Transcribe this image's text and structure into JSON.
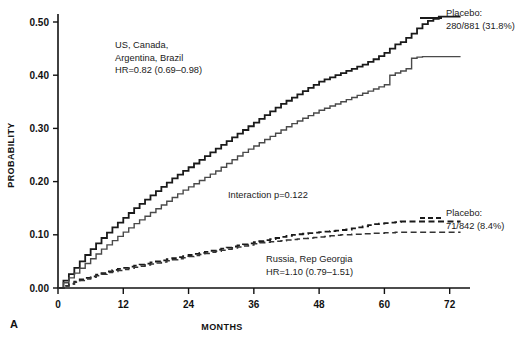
{
  "figure": {
    "panel_letter": "A",
    "background": "#ffffff"
  },
  "chart_data": {
    "type": "line",
    "title": "",
    "subtitle": "",
    "xlabel": "MONTHS",
    "ylabel": "PROBABILITY",
    "xlim": [
      0,
      75
    ],
    "ylim": [
      0.0,
      0.53
    ],
    "xticks": [
      0,
      12,
      24,
      36,
      48,
      60,
      72
    ],
    "xtick_labels": [
      "0",
      "12",
      "24",
      "36",
      "48",
      "60",
      "72"
    ],
    "yticks": [
      0.0,
      0.1,
      0.2,
      0.3,
      0.4,
      0.5
    ],
    "ytick_labels": [
      "0.00",
      "0.10",
      "0.20",
      "0.30",
      "0.40",
      "0.50"
    ],
    "grid": false,
    "legend_position": "right-inline",
    "curve_style": "kaplan-meier-step",
    "series": [
      {
        "name": "US, Canada, Argentina, Brazil — Placebo",
        "linestyle": "solid",
        "color": "#1a1a1a",
        "linewidth": 1.8,
        "x": [
          0,
          1,
          2,
          3,
          4,
          5,
          6,
          7,
          8,
          9,
          10,
          11,
          12,
          13,
          14,
          15,
          16,
          17,
          18,
          19,
          20,
          21,
          22,
          23,
          24,
          25,
          26,
          27,
          28,
          29,
          30,
          31,
          32,
          33,
          34,
          35,
          36,
          37,
          38,
          39,
          40,
          41,
          42,
          43,
          44,
          45,
          46,
          47,
          48,
          49,
          50,
          51,
          52,
          53,
          54,
          55,
          56,
          57,
          58,
          59,
          60,
          61,
          62,
          63,
          64,
          65,
          66,
          67,
          68,
          69,
          70,
          71,
          72,
          73,
          74
        ],
        "y": [
          0.0,
          0.014,
          0.026,
          0.038,
          0.05,
          0.062,
          0.073,
          0.084,
          0.094,
          0.104,
          0.114,
          0.123,
          0.132,
          0.141,
          0.15,
          0.158,
          0.166,
          0.174,
          0.182,
          0.19,
          0.198,
          0.206,
          0.213,
          0.22,
          0.227,
          0.234,
          0.241,
          0.248,
          0.255,
          0.262,
          0.269,
          0.276,
          0.283,
          0.29,
          0.297,
          0.304,
          0.311,
          0.318,
          0.325,
          0.332,
          0.339,
          0.346,
          0.352,
          0.358,
          0.364,
          0.37,
          0.376,
          0.382,
          0.388,
          0.392,
          0.396,
          0.4,
          0.404,
          0.408,
          0.412,
          0.416,
          0.42,
          0.425,
          0.43,
          0.436,
          0.442,
          0.45,
          0.458,
          0.462,
          0.47,
          0.478,
          0.488,
          0.496,
          0.502,
          0.506,
          0.51,
          0.51,
          0.51,
          0.51,
          0.51
        ]
      },
      {
        "name": "US, Canada, Argentina, Brazil — Treatment",
        "linestyle": "solid",
        "color": "#4a4a4a",
        "linewidth": 1.4,
        "x": [
          0,
          1,
          2,
          3,
          4,
          5,
          6,
          7,
          8,
          9,
          10,
          11,
          12,
          13,
          14,
          15,
          16,
          17,
          18,
          19,
          20,
          21,
          22,
          23,
          24,
          25,
          26,
          27,
          28,
          29,
          30,
          31,
          32,
          33,
          34,
          35,
          36,
          37,
          38,
          39,
          40,
          41,
          42,
          43,
          44,
          45,
          46,
          47,
          48,
          49,
          50,
          51,
          52,
          53,
          54,
          55,
          56,
          57,
          58,
          59,
          60,
          61,
          62,
          63,
          64,
          65,
          66,
          67,
          68,
          69,
          70,
          71,
          72,
          73,
          74
        ],
        "y": [
          0.0,
          0.01,
          0.019,
          0.028,
          0.037,
          0.046,
          0.055,
          0.064,
          0.073,
          0.081,
          0.089,
          0.097,
          0.105,
          0.113,
          0.121,
          0.128,
          0.135,
          0.142,
          0.149,
          0.156,
          0.163,
          0.17,
          0.177,
          0.184,
          0.19,
          0.196,
          0.202,
          0.208,
          0.214,
          0.22,
          0.227,
          0.234,
          0.241,
          0.248,
          0.255,
          0.261,
          0.267,
          0.273,
          0.279,
          0.285,
          0.291,
          0.297,
          0.303,
          0.309,
          0.314,
          0.319,
          0.324,
          0.329,
          0.334,
          0.338,
          0.342,
          0.346,
          0.35,
          0.354,
          0.358,
          0.362,
          0.366,
          0.37,
          0.374,
          0.378,
          0.382,
          0.4,
          0.404,
          0.408,
          0.412,
          0.432,
          0.434,
          0.435,
          0.435,
          0.435,
          0.435,
          0.435,
          0.435,
          0.435,
          0.435
        ]
      },
      {
        "name": "Russia, Rep Georgia — Placebo",
        "linestyle": "dashed",
        "color": "#1a1a1a",
        "linewidth": 1.8,
        "x": [
          0,
          1,
          2,
          3,
          4,
          5,
          6,
          7,
          8,
          9,
          10,
          11,
          12,
          13,
          14,
          15,
          16,
          17,
          18,
          19,
          20,
          21,
          22,
          23,
          24,
          25,
          26,
          27,
          28,
          29,
          30,
          31,
          32,
          33,
          34,
          35,
          36,
          37,
          38,
          39,
          40,
          41,
          42,
          43,
          44,
          45,
          46,
          47,
          48,
          49,
          50,
          51,
          52,
          53,
          54,
          55,
          56,
          57,
          58,
          59,
          60,
          61,
          62,
          63,
          64,
          65,
          66,
          67,
          68,
          69,
          70,
          71,
          72,
          73,
          74
        ],
        "y": [
          0.0,
          0.004,
          0.008,
          0.012,
          0.016,
          0.019,
          0.022,
          0.025,
          0.028,
          0.031,
          0.034,
          0.036,
          0.038,
          0.04,
          0.042,
          0.044,
          0.046,
          0.048,
          0.05,
          0.052,
          0.054,
          0.056,
          0.058,
          0.06,
          0.062,
          0.064,
          0.066,
          0.068,
          0.07,
          0.072,
          0.074,
          0.076,
          0.078,
          0.08,
          0.082,
          0.084,
          0.086,
          0.088,
          0.09,
          0.092,
          0.094,
          0.096,
          0.098,
          0.1,
          0.101,
          0.102,
          0.103,
          0.104,
          0.105,
          0.106,
          0.107,
          0.108,
          0.109,
          0.11,
          0.112,
          0.114,
          0.116,
          0.118,
          0.12,
          0.121,
          0.122,
          0.123,
          0.124,
          0.125,
          0.125,
          0.125,
          0.125,
          0.125,
          0.125,
          0.125,
          0.125,
          0.125,
          0.125,
          0.125,
          0.125
        ]
      },
      {
        "name": "Russia, Rep Georgia — Treatment",
        "linestyle": "dashed",
        "color": "#333333",
        "linewidth": 1.5,
        "x": [
          0,
          1,
          2,
          3,
          4,
          5,
          6,
          7,
          8,
          9,
          10,
          11,
          12,
          13,
          14,
          15,
          16,
          17,
          18,
          19,
          20,
          21,
          22,
          23,
          24,
          25,
          26,
          27,
          28,
          29,
          30,
          31,
          32,
          33,
          34,
          35,
          36,
          37,
          38,
          39,
          40,
          41,
          42,
          43,
          44,
          45,
          46,
          47,
          48,
          49,
          50,
          51,
          52,
          53,
          54,
          55,
          56,
          57,
          58,
          59,
          60,
          61,
          62,
          63,
          64,
          65,
          66,
          67,
          68,
          69,
          70,
          71,
          72,
          73,
          74
        ],
        "y": [
          0.0,
          0.004,
          0.008,
          0.011,
          0.014,
          0.017,
          0.02,
          0.023,
          0.026,
          0.029,
          0.031,
          0.033,
          0.035,
          0.037,
          0.039,
          0.041,
          0.043,
          0.045,
          0.047,
          0.049,
          0.051,
          0.053,
          0.055,
          0.057,
          0.059,
          0.061,
          0.063,
          0.065,
          0.067,
          0.069,
          0.071,
          0.073,
          0.075,
          0.077,
          0.079,
          0.081,
          0.083,
          0.085,
          0.086,
          0.087,
          0.088,
          0.089,
          0.09,
          0.091,
          0.092,
          0.093,
          0.094,
          0.095,
          0.096,
          0.097,
          0.098,
          0.099,
          0.1,
          0.1,
          0.101,
          0.101,
          0.102,
          0.102,
          0.103,
          0.103,
          0.104,
          0.104,
          0.105,
          0.105,
          0.105,
          0.105,
          0.105,
          0.105,
          0.105,
          0.105,
          0.105,
          0.105,
          0.105,
          0.105,
          0.105
        ]
      }
    ],
    "annotations": [
      {
        "id": "subgroup-1",
        "lines": [
          "US, Canada,",
          "Argentina, Brazil",
          "HR=0.82 (0.69–0.98)"
        ],
        "x_px": 115,
        "y_px": 48
      },
      {
        "id": "interaction-p",
        "lines": [
          "Interaction p=0.122"
        ],
        "x_px": 228,
        "y_px": 198
      },
      {
        "id": "subgroup-2",
        "lines": [
          "Russia, Rep Georgia",
          "HR=1.10 (0.79–1.51)"
        ],
        "x_px": 266,
        "y_px": 262
      }
    ],
    "curve_labels": [
      {
        "id": "placebo-upper",
        "lines": [
          "Placebo:",
          "280/881 (31.8%)"
        ],
        "linestyle": "solid",
        "x_px": 446,
        "y_px": 16
      },
      {
        "id": "placebo-lower",
        "lines": [
          "Placebo:",
          "71/842 (8.4%)"
        ],
        "linestyle": "dashed",
        "x_px": 446,
        "y_px": 216
      }
    ]
  }
}
